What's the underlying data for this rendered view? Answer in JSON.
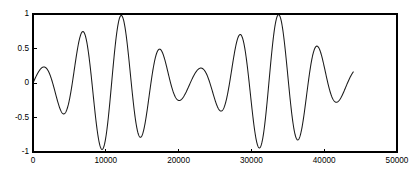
{
  "figure": {
    "background_color": "#ffffff",
    "axes_color": "#000000",
    "curve_color": "#1a1a1a"
  },
  "chart_data": {
    "type": "line",
    "title": "",
    "subtitle": "",
    "xlabel": "",
    "ylabel": "",
    "xlim": [
      0,
      50000
    ],
    "ylim": [
      -1,
      1
    ],
    "xticks": [
      0,
      10000,
      20000,
      30000,
      40000,
      50000
    ],
    "xticklabels": [
      "0",
      "10000",
      "20000",
      "30000",
      "40000",
      "50000"
    ],
    "yticks": [
      -1,
      -0.5,
      0,
      0.5,
      1
    ],
    "yticklabels": [
      "-1",
      "-0.5",
      "0",
      "0.5",
      "1"
    ],
    "grid": false,
    "legend": null,
    "legend_position": "none",
    "annotations": [],
    "series": [
      {
        "name": "beat waveform",
        "color": "#1a1a1a",
        "linewidth": 1,
        "description": "amplitude-modulated beat signal, carrier period about 5400 samples, beat envelope period about 22000 samples, envelope nodes near x = 0, 22000 and 44000 with residual amplitude 0.2, antinodes reaching 1.0 near x = 10800 and 33000",
        "x_start": 0,
        "x_end": 44000,
        "carrier_period": 5400,
        "envelope_period": 22000,
        "envelope_min": 0.2,
        "envelope_max": 1.0,
        "peaks": [
          {
            "x": 1400,
            "y": 0.2
          },
          {
            "x": 6200,
            "y": 0.77
          },
          {
            "x": 10800,
            "y": 1.0
          },
          {
            "x": 15600,
            "y": 0.77
          },
          {
            "x": 20300,
            "y": 0.2
          },
          {
            "x": 23600,
            "y": 0.2
          },
          {
            "x": 28200,
            "y": 0.77
          },
          {
            "x": 33000,
            "y": 1.0
          },
          {
            "x": 37800,
            "y": 0.77
          },
          {
            "x": 42400,
            "y": 0.2
          }
        ],
        "troughs": [
          {
            "x": 3800,
            "y": -0.52
          },
          {
            "x": 8500,
            "y": -0.95
          },
          {
            "x": 13300,
            "y": -0.95
          },
          {
            "x": 18000,
            "y": -0.53
          },
          {
            "x": 21900,
            "y": -0.05
          },
          {
            "x": 25800,
            "y": -0.53
          },
          {
            "x": 30500,
            "y": -0.95
          },
          {
            "x": 35300,
            "y": -0.95
          },
          {
            "x": 40100,
            "y": -0.52
          }
        ],
        "endpoints": [
          {
            "x": 0,
            "y": 0.0
          },
          {
            "x": 44000,
            "y": 0.02
          }
        ]
      }
    ]
  }
}
